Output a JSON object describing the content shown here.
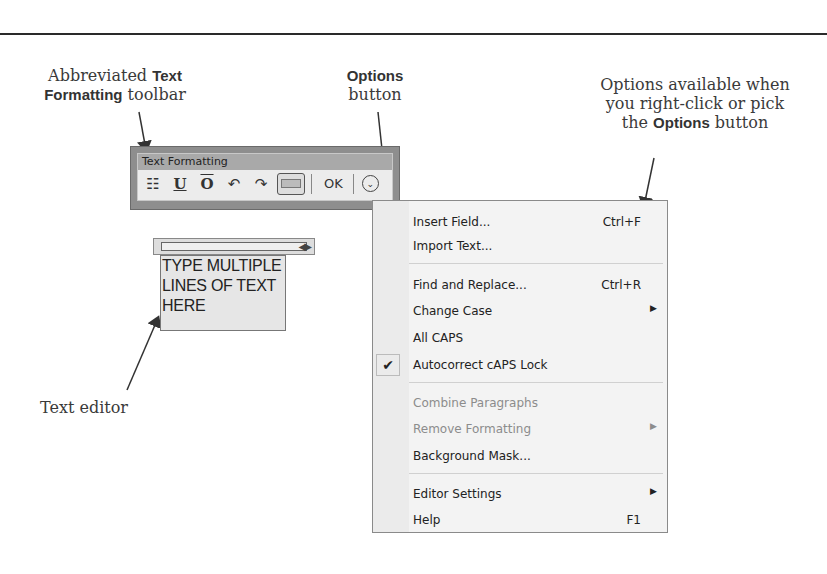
{
  "callouts": {
    "toolbar": {
      "pre": "Abbreviated ",
      "bold1": "Text",
      "bold2": "Formatting",
      "post": " toolbar"
    },
    "options_button": {
      "bold": "Options",
      "post": "button"
    },
    "menu": {
      "line1": "Options available when",
      "line2": "you right-click or pick",
      "pre3": "the ",
      "bold3": "Options",
      "post3": " button"
    },
    "editor": "Text editor"
  },
  "toolbar": {
    "title": "Text Formatting",
    "buttons": [
      {
        "name": "multiline-text",
        "glyph": "☷"
      },
      {
        "name": "underline",
        "glyph": "U"
      },
      {
        "name": "overline",
        "glyph": "O"
      },
      {
        "name": "undo",
        "glyph": "↶"
      },
      {
        "name": "redo",
        "glyph": "↷"
      },
      {
        "name": "ruler",
        "glyph": ""
      }
    ],
    "ok_label": "OK",
    "options_glyph": "⌄"
  },
  "editor": {
    "ruler_arrows": "◀▶",
    "lines": [
      "TYPE MULTIPLE",
      "LINES OF TEXT",
      "HERE"
    ]
  },
  "menu": {
    "items": [
      {
        "label": "Insert Field...",
        "shortcut": "Ctrl+F"
      },
      {
        "label": "Import Text...",
        "shortcut": ""
      },
      {
        "label": "Find and Replace...",
        "shortcut": "Ctrl+R"
      },
      {
        "label": "Change Case",
        "submenu": "▶"
      },
      {
        "label": "All CAPS"
      },
      {
        "label": "Autocorrect cAPS Lock",
        "checked": "✔"
      },
      {
        "label": "Combine Paragraphs",
        "disabled": true
      },
      {
        "label": "Remove Formatting",
        "disabled": true,
        "submenu": "▶"
      },
      {
        "label": "Background Mask..."
      },
      {
        "label": "Editor Settings",
        "submenu": "▶"
      },
      {
        "label": "Help",
        "shortcut": "F1"
      }
    ]
  }
}
